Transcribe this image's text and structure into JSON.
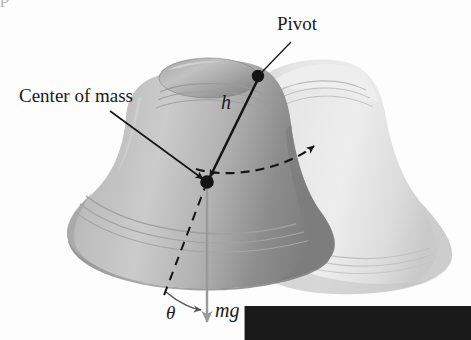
{
  "figure": {
    "background_color": "#fdfdfd"
  },
  "labels": {
    "pivot": "Pivot",
    "center_of_mass": "Center of mass",
    "h_vector_symbol": "h",
    "theta_symbol": "θ",
    "mg_mass_symbol": "m",
    "mg_gravity_symbol": "g"
  },
  "annotations": {
    "pivot_point": {
      "x": 258,
      "y": 76
    },
    "center_of_mass_point": {
      "x": 207,
      "y": 182
    },
    "h_vector": {
      "from_x": 258,
      "from_y": 76,
      "to_x": 207,
      "to_y": 182
    },
    "weight_vector": {
      "from_x": 207,
      "from_y": 182,
      "to_x": 207,
      "to_y": 332
    },
    "bell_axis_dashed": {
      "from_x": 207,
      "from_y": 182,
      "to_x": 163,
      "to_y": 298
    },
    "rotation_arc_dashed": {
      "from_x": 196,
      "from_y": 168,
      "to_x": 323,
      "to_y": 140
    }
  },
  "colors": {
    "line": "#141414",
    "weight_arrow": "#9a9a9a",
    "bell_near_dark": "#8f8f8f",
    "bell_near_mid": "#a8a8a8",
    "bell_near_light": "#c4c4c4",
    "bell_far_light": "#e2e2e2",
    "bell_far_mid": "#d2d2d2",
    "text": "#1a1a1a"
  },
  "top_cropped_text": "p"
}
